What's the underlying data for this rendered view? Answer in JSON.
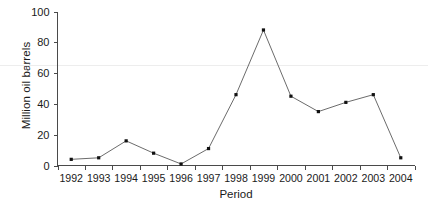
{
  "chart_data": {
    "type": "line",
    "title": "",
    "xlabel": "Period",
    "ylabel": "Million oil barrels",
    "categories": [
      "1992",
      "1993",
      "1994",
      "1995",
      "1996",
      "1997",
      "1998",
      "1999",
      "2000",
      "2001",
      "2002",
      "2003",
      "2004"
    ],
    "values": [
      4,
      5,
      16,
      8,
      1,
      11,
      46,
      88,
      45,
      35,
      41,
      46,
      5
    ],
    "series": [
      {
        "name": "Million oil barrels",
        "values": [
          4,
          5,
          16,
          8,
          1,
          11,
          46,
          88,
          45,
          35,
          41,
          46,
          5
        ]
      }
    ],
    "ylim": [
      0,
      100
    ],
    "yticks": [
      0,
      20,
      40,
      60,
      80,
      100
    ],
    "ytick_labels": [
      "0",
      "20",
      "40",
      "60",
      "80",
      "100"
    ],
    "xtick_labels": [
      "1992",
      "1993",
      "1994",
      "1995",
      "1996",
      "1997",
      "1998",
      "1999",
      "2000",
      "2001",
      "2002",
      "2003",
      "2004"
    ],
    "grid": "single faint horizontal gridline at y=65",
    "gridlines_y": [
      65
    ],
    "legend": "none",
    "legend_position": "none",
    "marker": "filled square",
    "line_color": "#5a5a5a",
    "marker_color": "#111111",
    "grid_color": "#ededed",
    "axis_color": "#4a4a4a",
    "background": "#ffffff"
  },
  "axes": {
    "y_title": "Million oil barrels",
    "x_title": "Period"
  }
}
